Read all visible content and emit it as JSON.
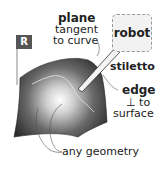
{
  "diagram": {
    "flag_label": "R",
    "robot_label": "robot",
    "plane_title": "plane",
    "plane_line2": "tangent",
    "plane_line3": "to curve",
    "stiletto_label": "stiletto",
    "edge_line1": "edge",
    "edge_line2": "⊥ to",
    "edge_line3": "surface",
    "geometry_label": "any geometry"
  },
  "colors": {
    "surface_dark": "#2e2e2e",
    "surface_light": "#f0f0f0",
    "flag": "#555555",
    "robot_border": "#999999",
    "text": "#222222"
  }
}
